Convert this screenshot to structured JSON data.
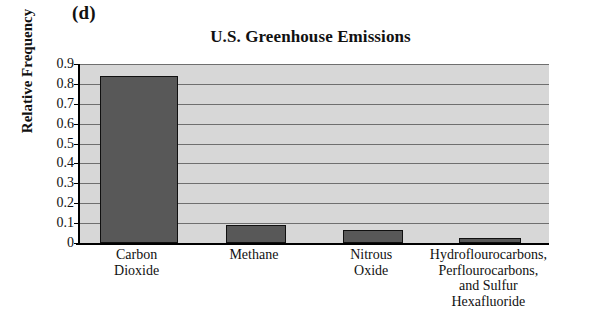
{
  "panel": {
    "label": "(d)"
  },
  "chart_data": {
    "type": "bar",
    "title": "U.S. Greenhouse Emissions",
    "xlabel": "",
    "ylabel": "Relative Frequency",
    "ylim": [
      0,
      0.9
    ],
    "grid": true,
    "legend": "none",
    "categories": [
      "Carbon Dioxide",
      "Methane",
      "Nitrous Oxide",
      "Hydroflourocarbons, Perflourocarbons, and Sulfur Hexafluoride"
    ],
    "category_lines": [
      [
        "Carbon",
        "Dioxide"
      ],
      [
        "Methane"
      ],
      [
        "Nitrous",
        "Oxide"
      ],
      [
        "Hydroflourocarbons,",
        "Perflourocarbons,",
        "and Sulfur",
        "Hexafluoride"
      ]
    ],
    "values": [
      0.84,
      0.09,
      0.065,
      0.025
    ],
    "ytick_labels": [
      "0.9",
      "0.8",
      "0.7",
      "0.6",
      "0.5",
      "0.4",
      "0.3",
      "0.2",
      "0.1",
      "0"
    ],
    "ytick_values": [
      0.9,
      0.8,
      0.7,
      0.6,
      0.5,
      0.4,
      0.3,
      0.2,
      0.1,
      0
    ],
    "bar_color": "#585858",
    "bar_edge_color": "#101010",
    "plot_background": "#d7d7d7",
    "gridline_color": "#6f6f6f",
    "axis_color": "#000000"
  }
}
